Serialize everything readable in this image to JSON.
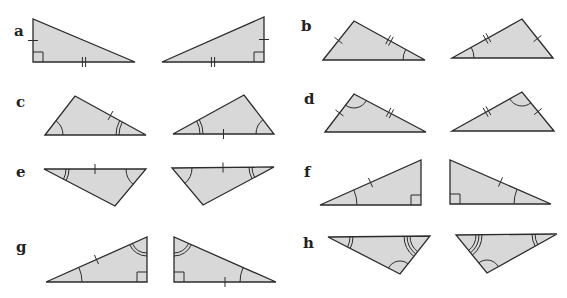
{
  "figure": {
    "width": 567,
    "height": 298,
    "fill_color": "#d8d8d8",
    "stroke_color": "#2b2b2b",
    "pairs": [
      {
        "label": "a",
        "label_pos": [
          14,
          36
        ],
        "triangles": [
          {
            "pts": [
              [
                33,
                19
              ],
              [
                33,
                62
              ],
              [
                135,
                62
              ]
            ],
            "marks": [
              {
                "type": "tick",
                "side": [
                  0,
                  1
                ],
                "n": 1
              },
              {
                "type": "tick",
                "side": [
                  1,
                  2
                ],
                "n": 2
              },
              {
                "type": "right",
                "vertex": 1,
                "size": 10
              }
            ]
          },
          {
            "pts": [
              [
                264,
                17
              ],
              [
                264,
                62
              ],
              [
                162,
                62
              ]
            ],
            "marks": [
              {
                "type": "tick",
                "side": [
                  0,
                  1
                ],
                "n": 1
              },
              {
                "type": "tick",
                "side": [
                  1,
                  2
                ],
                "n": 2
              },
              {
                "type": "right",
                "vertex": 1,
                "size": 10
              }
            ]
          }
        ]
      },
      {
        "label": "b",
        "label_pos": [
          301,
          31
        ],
        "triangles": [
          {
            "pts": [
              [
                323,
                60
              ],
              [
                354,
                21
              ],
              [
                425,
                60
              ]
            ],
            "marks": [
              {
                "type": "tick",
                "side": [
                  0,
                  1
                ],
                "n": 1
              },
              {
                "type": "tick",
                "side": [
                  1,
                  2
                ],
                "n": 2
              },
              {
                "type": "arc",
                "vertex": 2,
                "r": 22,
                "n": 1
              }
            ]
          },
          {
            "pts": [
              [
                553,
                58
              ],
              [
                522,
                19
              ],
              [
                452,
                58
              ]
            ],
            "marks": [
              {
                "type": "tick",
                "side": [
                  0,
                  1
                ],
                "n": 1
              },
              {
                "type": "tick",
                "side": [
                  1,
                  2
                ],
                "n": 2
              },
              {
                "type": "arc",
                "vertex": 2,
                "r": 22,
                "n": 1
              }
            ]
          }
        ]
      },
      {
        "label": "c",
        "label_pos": [
          16,
          107
        ],
        "triangles": [
          {
            "pts": [
              [
                45,
                135
              ],
              [
                75,
                96
              ],
              [
                146,
                135
              ]
            ],
            "marks": [
              {
                "type": "tick",
                "side": [
                  1,
                  2
                ],
                "n": 1
              },
              {
                "type": "arc",
                "vertex": 0,
                "r": 18,
                "n": 1
              },
              {
                "type": "arc",
                "vertex": 2,
                "r": 27,
                "n": 2
              }
            ]
          },
          {
            "pts": [
              [
                173,
                134
              ],
              [
                244,
                95
              ],
              [
                274,
                134
              ]
            ],
            "marks": [
              {
                "type": "tick",
                "side": [
                  0,
                  2
                ],
                "n": 1
              },
              {
                "type": "arc",
                "vertex": 0,
                "r": 27,
                "n": 2
              },
              {
                "type": "arc",
                "vertex": 2,
                "r": 18,
                "n": 1
              }
            ]
          }
        ]
      },
      {
        "label": "d",
        "label_pos": [
          304,
          104
        ],
        "triangles": [
          {
            "pts": [
              [
                325,
                132
              ],
              [
                354,
                94
              ],
              [
                426,
                132
              ]
            ],
            "marks": [
              {
                "type": "tick",
                "side": [
                  0,
                  1
                ],
                "n": 1
              },
              {
                "type": "tick",
                "side": [
                  1,
                  2
                ],
                "n": 2
              },
              {
                "type": "arc",
                "vertex": 1,
                "r": 14,
                "n": 1
              }
            ]
          },
          {
            "pts": [
              [
                554,
                131
              ],
              [
                522,
                92
              ],
              [
                452,
                131
              ]
            ],
            "marks": [
              {
                "type": "tick",
                "side": [
                  0,
                  1
                ],
                "n": 1
              },
              {
                "type": "tick",
                "side": [
                  1,
                  2
                ],
                "n": 2
              },
              {
                "type": "arc",
                "vertex": 1,
                "r": 14,
                "n": 1
              }
            ]
          }
        ]
      },
      {
        "label": "e",
        "label_pos": [
          16,
          177
        ],
        "triangles": [
          {
            "pts": [
              [
                44,
                169
              ],
              [
                146,
                169
              ],
              [
                115,
                206
              ]
            ],
            "marks": [
              {
                "type": "tick",
                "side": [
                  0,
                  1
                ],
                "n": 1
              },
              {
                "type": "arc",
                "vertex": 0,
                "r": 22,
                "n": 2
              },
              {
                "type": "arc",
                "vertex": 1,
                "r": 20,
                "n": 1
              }
            ]
          },
          {
            "pts": [
              [
                274,
                167
              ],
              [
                172,
                168
              ],
              [
                203,
                205
              ]
            ],
            "marks": [
              {
                "type": "tick",
                "side": [
                  0,
                  1
                ],
                "n": 1
              },
              {
                "type": "arc",
                "vertex": 0,
                "r": 22,
                "n": 2
              },
              {
                "type": "arc",
                "vertex": 1,
                "r": 20,
                "n": 1
              }
            ]
          }
        ]
      },
      {
        "label": "f",
        "label_pos": [
          304,
          177
        ],
        "triangles": [
          {
            "pts": [
              [
                320,
                205
              ],
              [
                421,
                160
              ],
              [
                421,
                205
              ]
            ],
            "marks": [
              {
                "type": "tick",
                "side": [
                  0,
                  1
                ],
                "n": 1
              },
              {
                "type": "arc",
                "vertex": 0,
                "r": 37,
                "n": 1
              },
              {
                "type": "right",
                "vertex": 2,
                "size": 10
              }
            ]
          },
          {
            "pts": [
              [
                551,
                204
              ],
              [
                450,
                160
              ],
              [
                450,
                204
              ]
            ],
            "marks": [
              {
                "type": "tick",
                "side": [
                  0,
                  1
                ],
                "n": 1
              },
              {
                "type": "arc",
                "vertex": 0,
                "r": 37,
                "n": 1
              },
              {
                "type": "right",
                "vertex": 2,
                "size": 10
              }
            ]
          }
        ]
      },
      {
        "label": "g",
        "label_pos": [
          16,
          252
        ],
        "triangles": [
          {
            "pts": [
              [
                46,
                282
              ],
              [
                147,
                237
              ],
              [
                147,
                282
              ]
            ],
            "marks": [
              {
                "type": "tick",
                "side": [
                  0,
                  1
                ],
                "n": 1
              },
              {
                "type": "arc",
                "vertex": 0,
                "r": 36,
                "n": 1
              },
              {
                "type": "arc",
                "vertex": 1,
                "r": 16,
                "n": 2
              },
              {
                "type": "right",
                "vertex": 2,
                "size": 10
              }
            ]
          },
          {
            "pts": [
              [
                276,
                282
              ],
              [
                174,
                237
              ],
              [
                174,
                282
              ]
            ],
            "marks": [
              {
                "type": "tick",
                "side": [
                  0,
                  2
                ],
                "n": 1
              },
              {
                "type": "arc",
                "vertex": 0,
                "r": 36,
                "n": 1
              },
              {
                "type": "arc",
                "vertex": 1,
                "r": 16,
                "n": 2
              },
              {
                "type": "right",
                "vertex": 2,
                "size": 10
              }
            ]
          }
        ]
      },
      {
        "label": "h",
        "label_pos": [
          303,
          248
        ],
        "triangles": [
          {
            "pts": [
              [
                328,
                237
              ],
              [
                430,
                236
              ],
              [
                400,
                274
              ]
            ],
            "marks": [
              {
                "type": "arc",
                "vertex": 0,
                "r": 22,
                "n": 2
              },
              {
                "type": "arc",
                "vertex": 1,
                "r": 20,
                "n": 3
              },
              {
                "type": "arc",
                "vertex": 2,
                "r": 13,
                "n": 1
              }
            ]
          },
          {
            "pts": [
              [
                557,
                234
              ],
              [
                456,
                235
              ],
              [
                487,
                273
              ]
            ],
            "marks": [
              {
                "type": "arc",
                "vertex": 0,
                "r": 22,
                "n": 2
              },
              {
                "type": "arc",
                "vertex": 1,
                "r": 20,
                "n": 3
              },
              {
                "type": "arc",
                "vertex": 2,
                "r": 13,
                "n": 1
              }
            ]
          }
        ]
      }
    ]
  }
}
